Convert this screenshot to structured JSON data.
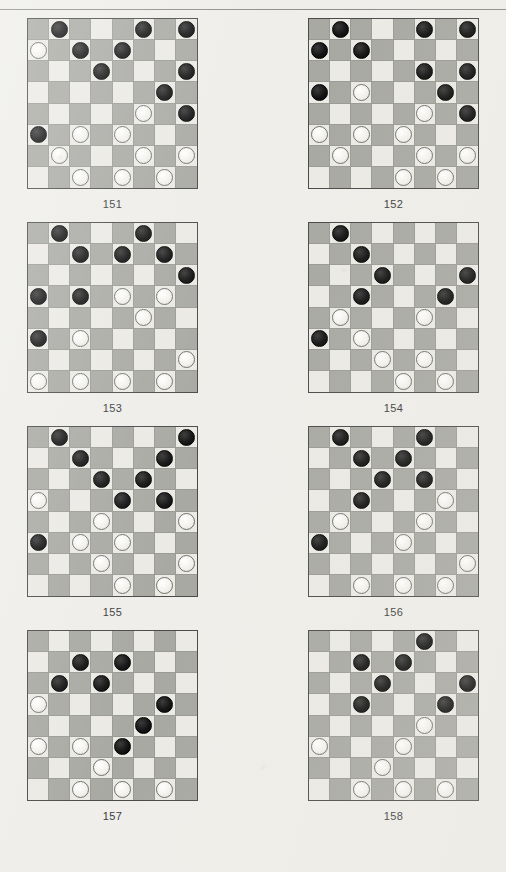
{
  "page": {
    "bleed_text": "",
    "board_size": 8,
    "colors": {
      "light_square": "#ebeae5",
      "dark_square": "#a9a9a4",
      "black_piece": "#141414",
      "white_piece": "#f2f1ec",
      "paper": "#efeeea",
      "rule": "#8d8d8d",
      "caption_text": "#3c3c3c"
    }
  },
  "chart_data": {
    "type": "table",
    "diagrams": [
      {
        "caption": "151",
        "black": [
          [
            0,
            1
          ],
          [
            0,
            5
          ],
          [
            0,
            7
          ],
          [
            1,
            2
          ],
          [
            1,
            4
          ],
          [
            2,
            3
          ],
          [
            2,
            7
          ],
          [
            3,
            6
          ],
          [
            4,
            7
          ],
          [
            5,
            0
          ]
        ],
        "white": [
          [
            1,
            0
          ],
          [
            4,
            5
          ],
          [
            5,
            2
          ],
          [
            5,
            4
          ],
          [
            6,
            1
          ],
          [
            6,
            5
          ],
          [
            6,
            7
          ],
          [
            7,
            2
          ],
          [
            7,
            4
          ],
          [
            7,
            6
          ]
        ]
      },
      {
        "caption": "152",
        "black": [
          [
            0,
            1
          ],
          [
            0,
            5
          ],
          [
            0,
            7
          ],
          [
            1,
            0
          ],
          [
            1,
            2
          ],
          [
            2,
            5
          ],
          [
            2,
            7
          ],
          [
            3,
            0
          ],
          [
            3,
            6
          ],
          [
            4,
            7
          ]
        ],
        "white": [
          [
            3,
            2
          ],
          [
            4,
            5
          ],
          [
            5,
            0
          ],
          [
            5,
            2
          ],
          [
            5,
            4
          ],
          [
            6,
            1
          ],
          [
            6,
            5
          ],
          [
            6,
            7
          ],
          [
            7,
            4
          ],
          [
            7,
            6
          ]
        ]
      },
      {
        "caption": "153",
        "black": [
          [
            0,
            1
          ],
          [
            0,
            5
          ],
          [
            1,
            2
          ],
          [
            1,
            4
          ],
          [
            1,
            6
          ],
          [
            2,
            7
          ],
          [
            3,
            0
          ],
          [
            3,
            2
          ],
          [
            5,
            0
          ]
        ],
        "white": [
          [
            3,
            4
          ],
          [
            3,
            6
          ],
          [
            4,
            5
          ],
          [
            5,
            2
          ],
          [
            6,
            7
          ],
          [
            7,
            0
          ],
          [
            7,
            2
          ],
          [
            7,
            4
          ],
          [
            7,
            6
          ]
        ]
      },
      {
        "caption": "154",
        "black": [
          [
            0,
            1
          ],
          [
            1,
            2
          ],
          [
            2,
            3
          ],
          [
            2,
            7
          ],
          [
            3,
            2
          ],
          [
            3,
            6
          ],
          [
            5,
            0
          ]
        ],
        "white": [
          [
            4,
            1
          ],
          [
            4,
            5
          ],
          [
            5,
            2
          ],
          [
            6,
            3
          ],
          [
            6,
            5
          ],
          [
            7,
            4
          ],
          [
            7,
            6
          ]
        ]
      },
      {
        "caption": "155",
        "black": [
          [
            0,
            1
          ],
          [
            0,
            7
          ],
          [
            1,
            2
          ],
          [
            1,
            6
          ],
          [
            2,
            3
          ],
          [
            2,
            5
          ],
          [
            3,
            4
          ],
          [
            3,
            6
          ],
          [
            5,
            0
          ]
        ],
        "white": [
          [
            3,
            0
          ],
          [
            4,
            3
          ],
          [
            4,
            7
          ],
          [
            5,
            2
          ],
          [
            5,
            4
          ],
          [
            6,
            3
          ],
          [
            6,
            7
          ],
          [
            7,
            4
          ],
          [
            7,
            6
          ]
        ]
      },
      {
        "caption": "156",
        "black": [
          [
            0,
            1
          ],
          [
            0,
            5
          ],
          [
            1,
            2
          ],
          [
            1,
            4
          ],
          [
            2,
            3
          ],
          [
            2,
            5
          ],
          [
            3,
            2
          ],
          [
            5,
            0
          ]
        ],
        "white": [
          [
            3,
            6
          ],
          [
            4,
            1
          ],
          [
            4,
            5
          ],
          [
            5,
            4
          ],
          [
            6,
            7
          ],
          [
            7,
            2
          ],
          [
            7,
            4
          ],
          [
            7,
            6
          ]
        ]
      },
      {
        "caption": "157",
        "black": [
          [
            1,
            2
          ],
          [
            1,
            4
          ],
          [
            2,
            1
          ],
          [
            2,
            3
          ],
          [
            3,
            6
          ],
          [
            4,
            5
          ],
          [
            5,
            4
          ]
        ],
        "white": [
          [
            3,
            0
          ],
          [
            5,
            0
          ],
          [
            5,
            2
          ],
          [
            6,
            3
          ],
          [
            7,
            2
          ],
          [
            7,
            4
          ],
          [
            7,
            6
          ]
        ]
      },
      {
        "caption": "158",
        "black": [
          [
            0,
            5
          ],
          [
            1,
            2
          ],
          [
            1,
            4
          ],
          [
            2,
            3
          ],
          [
            2,
            7
          ],
          [
            3,
            2
          ],
          [
            3,
            6
          ]
        ],
        "white": [
          [
            4,
            5
          ],
          [
            5,
            0
          ],
          [
            5,
            4
          ],
          [
            6,
            3
          ],
          [
            7,
            2
          ],
          [
            7,
            4
          ],
          [
            7,
            6
          ]
        ]
      }
    ]
  }
}
